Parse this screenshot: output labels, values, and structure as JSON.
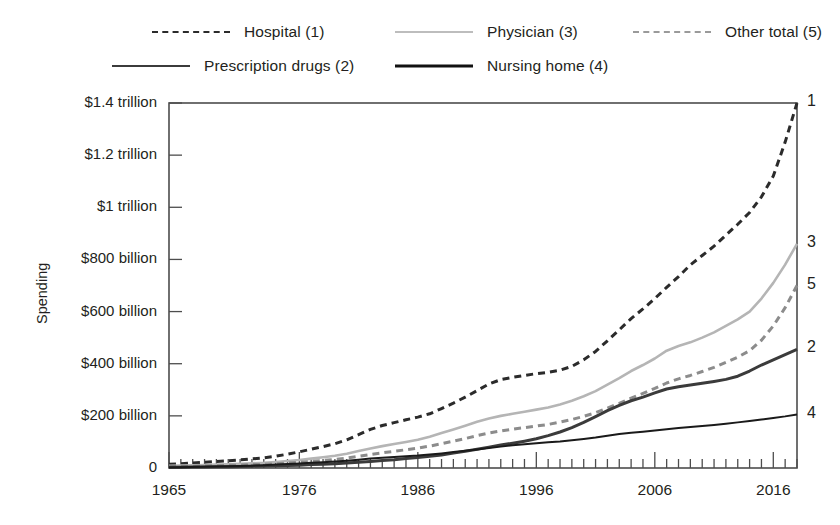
{
  "chart_data": {
    "type": "line",
    "title": "",
    "xlabel": "",
    "ylabel": "Spending",
    "xlim": [
      1965,
      2018
    ],
    "ylim": [
      0,
      1400
    ],
    "grid": false,
    "legend_position": "top",
    "y_unit": "billions of US dollars",
    "y_ticks": [
      0,
      200,
      400,
      600,
      800,
      1000,
      1200,
      1400
    ],
    "y_ticklabels": [
      "0",
      "$200 billion",
      "$400 billion",
      "$600 billion",
      "$800 billion",
      "$1 trillion",
      "$1.2 trillion",
      "$1.4 trillion"
    ],
    "x_ticks": [
      1965,
      1976,
      1986,
      1996,
      2006,
      2016
    ],
    "x_ticklabels": [
      "1965",
      "1976",
      "1986",
      "1996",
      "2006",
      "2016"
    ],
    "x_minor_tick_step": 1,
    "x": [
      1965,
      1966,
      1967,
      1968,
      1969,
      1970,
      1971,
      1972,
      1973,
      1974,
      1975,
      1976,
      1977,
      1978,
      1979,
      1980,
      1981,
      1982,
      1983,
      1984,
      1985,
      1986,
      1987,
      1988,
      1989,
      1990,
      1991,
      1992,
      1993,
      1994,
      1995,
      1996,
      1997,
      1998,
      1999,
      2000,
      2001,
      2002,
      2003,
      2004,
      2005,
      2006,
      2007,
      2008,
      2009,
      2010,
      2011,
      2012,
      2013,
      2014,
      2015,
      2016,
      2017,
      2018
    ],
    "series": [
      {
        "name": "Hospital",
        "key": 1,
        "end_label": "1",
        "style": "dashed",
        "color": "#2b2b2b",
        "width": 3.0,
        "dash": "7,5",
        "end_value": 1400,
        "values": [
          14,
          16,
          19,
          22,
          25,
          28,
          31,
          35,
          39,
          45,
          53,
          62,
          72,
          82,
          93,
          108,
          128,
          148,
          163,
          174,
          185,
          195,
          208,
          228,
          249,
          272,
          297,
          322,
          339,
          348,
          355,
          362,
          367,
          375,
          390,
          415,
          447,
          488,
          530,
          573,
          610,
          650,
          693,
          734,
          779,
          815,
          851,
          893,
          935,
          980,
          1040,
          1120,
          1250,
          1400
        ]
      },
      {
        "name": "Physician",
        "key": 3,
        "end_label": "3",
        "style": "solid",
        "color": "#b5b5b5",
        "width": 2.6,
        "dash": "",
        "end_value": 860,
        "values": [
          8,
          9,
          10,
          11,
          13,
          14,
          16,
          18,
          20,
          23,
          27,
          31,
          36,
          41,
          47,
          55,
          65,
          75,
          84,
          92,
          100,
          108,
          120,
          134,
          148,
          162,
          177,
          190,
          200,
          208,
          216,
          224,
          232,
          244,
          258,
          275,
          295,
          320,
          345,
          372,
          395,
          420,
          450,
          468,
          482,
          500,
          520,
          545,
          570,
          600,
          650,
          710,
          780,
          860
        ]
      },
      {
        "name": "Other total",
        "key": 5,
        "end_label": "5",
        "style": "dashed",
        "color": "#8c8c8c",
        "width": 3.0,
        "dash": "7,5",
        "end_value": 700,
        "values": [
          5,
          6,
          7,
          8,
          9,
          10,
          11,
          13,
          14,
          16,
          19,
          22,
          25,
          29,
          33,
          38,
          45,
          52,
          58,
          64,
          70,
          76,
          84,
          93,
          103,
          113,
          124,
          134,
          142,
          149,
          155,
          161,
          167,
          176,
          186,
          198,
          212,
          230,
          248,
          268,
          286,
          305,
          326,
          342,
          355,
          370,
          386,
          405,
          425,
          450,
          490,
          545,
          615,
          700
        ]
      },
      {
        "name": "Prescription drugs",
        "key": 2,
        "end_label": "2",
        "style": "solid",
        "color": "#3b3b3b",
        "width": 3.0,
        "dash": "",
        "end_value": 455,
        "values": [
          3,
          3,
          4,
          4,
          5,
          5,
          6,
          7,
          8,
          9,
          10,
          11,
          13,
          14,
          16,
          19,
          22,
          25,
          29,
          32,
          36,
          40,
          45,
          50,
          57,
          64,
          72,
          80,
          88,
          95,
          103,
          112,
          124,
          138,
          155,
          175,
          197,
          220,
          240,
          258,
          272,
          288,
          303,
          312,
          318,
          325,
          332,
          340,
          352,
          372,
          395,
          415,
          435,
          455
        ]
      },
      {
        "name": "Nursing home",
        "key": 4,
        "end_label": "4",
        "style": "solid",
        "color": "#1a1a1a",
        "width": 2.0,
        "dash": "",
        "end_value": 205,
        "values": [
          2,
          3,
          4,
          5,
          6,
          7,
          8,
          9,
          11,
          13,
          15,
          17,
          20,
          22,
          25,
          28,
          32,
          36,
          39,
          42,
          45,
          48,
          52,
          56,
          61,
          66,
          71,
          77,
          82,
          87,
          91,
          95,
          99,
          102,
          106,
          111,
          117,
          124,
          130,
          135,
          139,
          144,
          149,
          153,
          157,
          161,
          165,
          170,
          175,
          180,
          186,
          192,
          198,
          205
        ]
      }
    ]
  },
  "legend": {
    "items": [
      {
        "label": "Hospital (1)",
        "swatch": "dashed-dark"
      },
      {
        "label": "Physician (3)",
        "swatch": "solid-light"
      },
      {
        "label": "Other total (5)",
        "swatch": "dashed-gray"
      },
      {
        "label": "Prescription drugs (2)",
        "swatch": "solid-dark"
      },
      {
        "label": "Nursing home (4)",
        "swatch": "solid-black"
      }
    ]
  }
}
